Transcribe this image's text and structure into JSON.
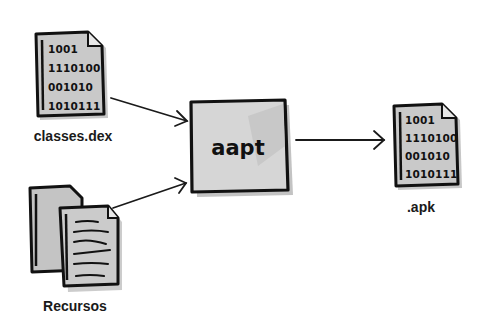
{
  "diagram": {
    "nodes": {
      "classes_dex": {
        "label": "classes.dex",
        "icon": "binary-file-icon",
        "lines": [
          "1001",
          "1110100",
          "001010",
          "1010111"
        ]
      },
      "recursos": {
        "label": "Recursos",
        "icon": "documents-stack-icon"
      },
      "aapt": {
        "label": "aapt",
        "shape": "box"
      },
      "apk": {
        "label": ".apk",
        "icon": "binary-file-icon",
        "lines": [
          "1001",
          "1110100",
          "001010",
          "1010111"
        ]
      }
    },
    "edges": [
      {
        "from": "classes.dex",
        "to": "aapt"
      },
      {
        "from": "Recursos",
        "to": "aapt"
      },
      {
        "from": "aapt",
        "to": ".apk"
      }
    ],
    "colors": {
      "background": "#ffffff",
      "fill": "#c9c9c9",
      "fill_light": "#e2e2e2",
      "stroke": "#111111"
    }
  }
}
